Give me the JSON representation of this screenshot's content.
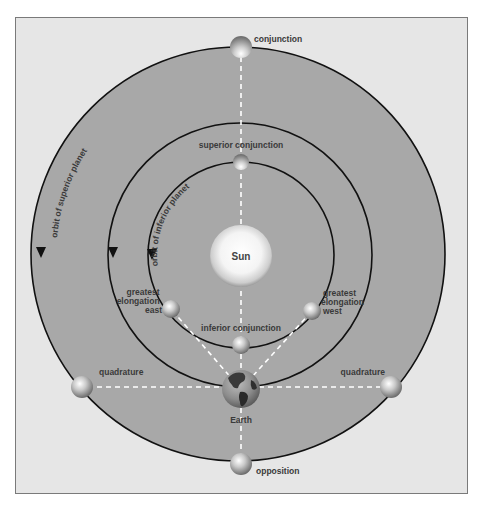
{
  "diagram": {
    "colors": {
      "page_bg": "#ffffff",
      "frame_bg": "#e6e6e6",
      "frame_border": "#7a7a7a",
      "orbit_fill": "#a8a8a8",
      "orbit_stroke": "#111111",
      "dash_color": "#ffffff",
      "label_color": "#3a3a3a"
    },
    "bodies": {
      "sun": {
        "label": "Sun"
      },
      "earth": {
        "label": "Earth"
      }
    },
    "orbits": {
      "superior_label": "orbit of superior planet",
      "inferior_label": "orbit of inferior planet"
    },
    "positions": {
      "conjunction": "conjunction",
      "superior_conjunction": "superior conjunction",
      "inferior_conjunction": "inferior conjunction",
      "greatest_elongation_east": [
        "greatest",
        "elongation",
        "east"
      ],
      "greatest_elongation_west": [
        "greatest",
        "elongation",
        "west"
      ],
      "quadrature_left": "quadrature",
      "quadrature_right": "quadrature",
      "opposition": "opposition"
    }
  }
}
